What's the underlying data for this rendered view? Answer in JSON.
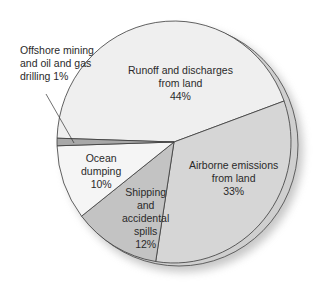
{
  "chart_data": {
    "type": "pie",
    "title": "",
    "style": "3d-pie-with-shadow",
    "slices": [
      {
        "label": "Runoff and discharges from land",
        "value": 44,
        "color": "#efefef"
      },
      {
        "label": "Airborne emissions from land",
        "value": 33,
        "color": "#d6d6d6"
      },
      {
        "label": "Shipping and accidental spills",
        "value": 12,
        "color": "#c3c3c3"
      },
      {
        "label": "Ocean dumping",
        "value": 10,
        "color": "#f5f5f5"
      },
      {
        "label": "Offshore mining and oil and gas drilling",
        "value": 1,
        "color": "#a8a8a8"
      }
    ],
    "unit": "%",
    "legend": "none (labels placed on slices)"
  },
  "labels": {
    "runoff": {
      "line1": "Runoff and discharges",
      "line2": "from land",
      "line3": "44%"
    },
    "airborne": {
      "line1": "Airborne emissions",
      "line2": "from land",
      "line3": "33%"
    },
    "shipping": {
      "line1": "Shipping",
      "line2": "and",
      "line3": "accidental",
      "line4": "spills",
      "line5": "12%"
    },
    "ocean": {
      "line1": "Ocean",
      "line2": "dumping",
      "line3": "10%"
    },
    "offshore": {
      "line1": "Offshore mining",
      "line2": "and oil and gas",
      "line3": "drilling 1%"
    }
  }
}
